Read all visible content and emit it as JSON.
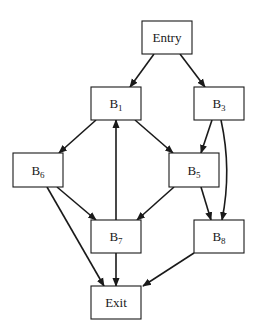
{
  "diagram": {
    "type": "control-flow-graph",
    "colors": {
      "stroke": "#1a1a1a",
      "node_fill": "#ffffff",
      "background": "#ffffff"
    },
    "nodes": [
      {
        "id": "entry",
        "label": "Entry",
        "base": "Entry",
        "sub": "",
        "x": 142,
        "y": 21,
        "w": 50,
        "h": 33
      },
      {
        "id": "b1",
        "label": "B1",
        "base": "B",
        "sub": "1",
        "x": 91,
        "y": 87,
        "w": 50,
        "h": 33
      },
      {
        "id": "b3",
        "label": "B3",
        "base": "B",
        "sub": "3",
        "x": 194,
        "y": 87,
        "w": 50,
        "h": 33
      },
      {
        "id": "b6",
        "label": "B6",
        "base": "B",
        "sub": "6",
        "x": 13,
        "y": 153,
        "w": 50,
        "h": 34
      },
      {
        "id": "b5",
        "label": "B5",
        "base": "B",
        "sub": "5",
        "x": 169,
        "y": 153,
        "w": 50,
        "h": 34
      },
      {
        "id": "b7",
        "label": "B7",
        "base": "B",
        "sub": "7",
        "x": 91,
        "y": 220,
        "w": 50,
        "h": 33
      },
      {
        "id": "b8",
        "label": "B8",
        "base": "B",
        "sub": "8",
        "x": 194,
        "y": 220,
        "w": 50,
        "h": 33
      },
      {
        "id": "exit",
        "label": "Exit",
        "base": "Exit",
        "sub": "",
        "x": 91,
        "y": 286,
        "w": 50,
        "h": 33
      }
    ],
    "edges": [
      {
        "from": "entry",
        "to": "b1",
        "path": "M154,54 L130,87"
      },
      {
        "from": "entry",
        "to": "b3",
        "path": "M180,54 L205,87"
      },
      {
        "from": "b1",
        "to": "b6",
        "path": "M96,120 L59,153"
      },
      {
        "from": "b1",
        "to": "b5",
        "path": "M135,120 L173,153"
      },
      {
        "from": "b3",
        "to": "b5",
        "path": "M212,120 L201,153"
      },
      {
        "from": "b3",
        "to": "b8",
        "path": "M221,120 Q232,170 222,220"
      },
      {
        "from": "b6",
        "to": "b7",
        "path": "M57,187 L96,220"
      },
      {
        "from": "b6",
        "to": "exit",
        "path": "M47,187 L104,286"
      },
      {
        "from": "b5",
        "to": "b7",
        "path": "M174,187 L137,220"
      },
      {
        "from": "b5",
        "to": "b8",
        "path": "M201,187 L211,220"
      },
      {
        "from": "b7",
        "to": "b1",
        "path": "M116,220 L116,120"
      },
      {
        "from": "b7",
        "to": "exit",
        "path": "M116,253 L116,286"
      },
      {
        "from": "b8",
        "to": "exit",
        "path": "M194,253 L143,286"
      }
    ]
  }
}
